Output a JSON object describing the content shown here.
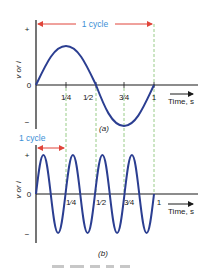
{
  "colors": {
    "wave": "#2b3e91",
    "axis": "#1a1a1a",
    "cycle_arrow": "#e0453a",
    "cycle_text": "#3b8fd6",
    "guide": "#7fbf6a"
  },
  "panel_a": {
    "cycle_label": "1 cycle",
    "y_axis_label": "v or i",
    "y_plus": "+",
    "y_zero": "0",
    "y_minus": "−",
    "ticks": [
      "1⁄4",
      "1⁄2",
      "3⁄4",
      "1"
    ],
    "x_axis_label": "Time, s",
    "panel_label": "(a)",
    "cycles_in_1s": 1
  },
  "panel_b": {
    "cycle_label": "1 cycle",
    "y_axis_label": "v or i",
    "y_plus": "+",
    "y_zero": "0",
    "y_minus": "−",
    "ticks": [
      "1⁄4",
      "1⁄2",
      "3⁄4",
      "1"
    ],
    "x_axis_label": "Time, s",
    "panel_label": "(b)",
    "cycles_in_1s": 4
  }
}
